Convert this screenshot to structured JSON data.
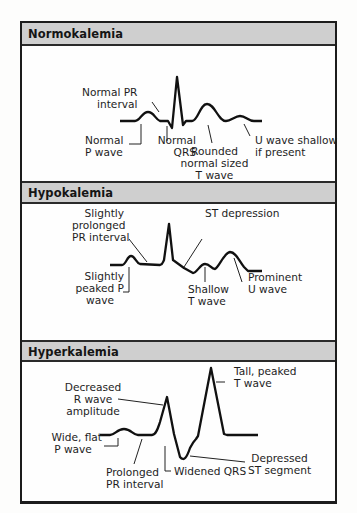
{
  "sections": [
    {
      "title": "Normokalemia",
      "labels": {
        "pr": [
          "Normal PR",
          "interval"
        ],
        "p": [
          "Normal",
          "P wave"
        ],
        "qrs": [
          "Normal",
          "QRS"
        ],
        "t": [
          "Rounded",
          "normal sized",
          "T wave"
        ],
        "u": [
          "U wave shallow",
          "if present"
        ]
      }
    },
    {
      "title": "Hypokalemia",
      "labels": {
        "pr": [
          "Slightly",
          "prolonged",
          "PR interval"
        ],
        "st": [
          "ST depression"
        ],
        "p": [
          "Slightly",
          "peaked P",
          "wave"
        ],
        "t": [
          "Shallow",
          "T wave"
        ],
        "u": [
          "Prominent",
          "U wave"
        ]
      }
    },
    {
      "title": "Hyperkalemia",
      "labels": {
        "r": [
          "Decreased",
          "R wave",
          "amplitude"
        ],
        "t": [
          "Tall, peaked",
          "T wave"
        ],
        "p": [
          "Wide, flat",
          "P wave"
        ],
        "st": [
          "Depressed",
          "ST segment"
        ],
        "pr": [
          "Prolonged",
          "PR interval"
        ],
        "qrs": [
          "Widened QRS"
        ]
      }
    }
  ],
  "colors": {
    "header_bg": "#cfcfcf",
    "border": "#1c1c1c",
    "trace": "#111111"
  }
}
